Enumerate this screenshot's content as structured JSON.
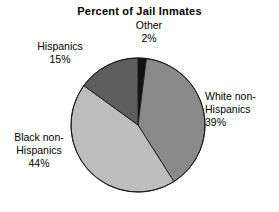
{
  "chart_data": {
    "type": "pie",
    "title": "Percent of Jail Inmates",
    "xlabel": "",
    "ylabel": "",
    "units": "percent",
    "legend_position": "none",
    "grid": false,
    "start_angle_deg": 0,
    "direction": "clockwise",
    "categories": [
      "Other",
      "White non-Hispanics",
      "Black non-Hispanics",
      "Hispanics"
    ],
    "values": [
      2,
      39,
      44,
      15
    ],
    "slices": [
      {
        "label": "Other",
        "value": 2,
        "value_text": "2%",
        "color": "#111111"
      },
      {
        "label": "White non-Hispanics",
        "value": 39,
        "value_text": "39%",
        "color": "#8a8a8a"
      },
      {
        "label": "Black non-Hispanics",
        "value": 44,
        "value_text": "44%",
        "color": "#bdbdbd"
      },
      {
        "label": "Hispanics",
        "value": 15,
        "value_text": "15%",
        "color": "#5e5e5e"
      }
    ]
  },
  "title": "Percent of Jail Inmates",
  "labels": {
    "other": "Other\n2%",
    "white": "White non-\nHispanics\n39%",
    "black": "Black non-\nHispanics\n44%",
    "hispanics": "Hispanics\n15%"
  },
  "colors": {
    "background": "#ffffff",
    "text": "#000000",
    "outline": "#1a1a1a",
    "other": "#111111",
    "white_non_hispanics": "#8a8a8a",
    "black_non_hispanics": "#bdbdbd",
    "hispanics": "#5e5e5e"
  }
}
